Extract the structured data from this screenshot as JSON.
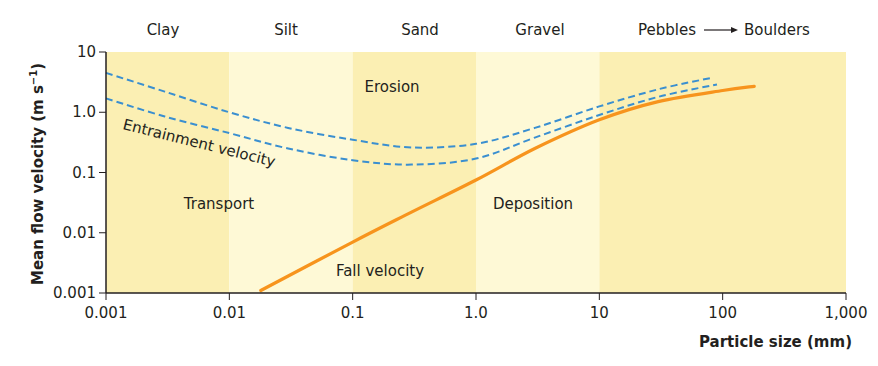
{
  "chart_data": {
    "type": "line",
    "title": "",
    "xlabel": "Particle size (mm)",
    "ylabel": "Mean flow velocity (m s⁻¹)",
    "xscale": "log",
    "yscale": "log",
    "xlim": [
      0.001,
      1000
    ],
    "ylim": [
      0.001,
      10
    ],
    "grid": false,
    "x_ticks": [
      {
        "value": 0.001,
        "label": "0.001"
      },
      {
        "value": 0.01,
        "label": "0.01"
      },
      {
        "value": 0.1,
        "label": "0.1"
      },
      {
        "value": 1,
        "label": "1.0"
      },
      {
        "value": 10,
        "label": "10"
      },
      {
        "value": 100,
        "label": "100"
      },
      {
        "value": 1000,
        "label": "1,000"
      }
    ],
    "y_ticks": [
      {
        "value": 10,
        "label": "10"
      },
      {
        "value": 1,
        "label": "1.0"
      },
      {
        "value": 0.1,
        "label": "0.1"
      },
      {
        "value": 0.01,
        "label": "0.01"
      },
      {
        "value": 0.001,
        "label": "0.001"
      }
    ],
    "bands": [
      {
        "name": "Clay",
        "x0": 0.001,
        "x1": 0.01,
        "color": "#fbefb3"
      },
      {
        "name": "Silt",
        "x0": 0.01,
        "x1": 0.1,
        "color": "#fef9d6"
      },
      {
        "name": "Sand",
        "x0": 0.1,
        "x1": 1,
        "color": "#fbefb3"
      },
      {
        "name": "Gravel",
        "x0": 1,
        "x1": 10,
        "color": "#fef9d6"
      },
      {
        "name": "Pebbles → Boulders",
        "x0": 10,
        "x1": 1000,
        "color": "#fbefb3"
      }
    ],
    "category_labels": [
      {
        "text": "Clay",
        "x": 0.0032
      },
      {
        "text": "Silt",
        "x": 0.031
      },
      {
        "text": "Sand",
        "x": 0.32
      },
      {
        "text": "Gravel",
        "x": 3.2
      },
      {
        "text": "Pebbles",
        "x": 30
      },
      {
        "text": "Boulders",
        "x": 330
      }
    ],
    "series": [
      {
        "name": "Entrainment velocity (upper bound)",
        "style": "dashed",
        "color": "#3a8fd0",
        "points": [
          [
            0.001,
            4.5
          ],
          [
            0.003,
            2.2
          ],
          [
            0.01,
            1.0
          ],
          [
            0.03,
            0.55
          ],
          [
            0.1,
            0.35
          ],
          [
            0.3,
            0.26
          ],
          [
            1,
            0.3
          ],
          [
            3,
            0.55
          ],
          [
            10,
            1.25
          ],
          [
            30,
            2.4
          ],
          [
            80,
            3.7
          ]
        ]
      },
      {
        "name": "Entrainment velocity (lower bound)",
        "style": "dashed",
        "color": "#3a8fd0",
        "points": [
          [
            0.001,
            1.7
          ],
          [
            0.003,
            0.85
          ],
          [
            0.01,
            0.45
          ],
          [
            0.03,
            0.25
          ],
          [
            0.1,
            0.16
          ],
          [
            0.3,
            0.135
          ],
          [
            1,
            0.17
          ],
          [
            3,
            0.38
          ],
          [
            10,
            0.9
          ],
          [
            30,
            1.8
          ],
          [
            90,
            2.9
          ]
        ]
      },
      {
        "name": "Fall velocity",
        "style": "solid",
        "color": "#f7941d",
        "points": [
          [
            0.018,
            0.0011
          ],
          [
            0.1,
            0.007
          ],
          [
            0.3,
            0.022
          ],
          [
            1,
            0.075
          ],
          [
            3,
            0.25
          ],
          [
            10,
            0.75
          ],
          [
            30,
            1.5
          ],
          [
            100,
            2.3
          ],
          [
            180,
            2.7
          ]
        ]
      }
    ],
    "annotations": [
      {
        "text": "Erosion",
        "x": 0.5,
        "y": 3.4
      },
      {
        "text": "Entrainment velocity",
        "x": 0.0014,
        "y": 0.4,
        "rotation": 14
      },
      {
        "text": "Transport",
        "x": 0.0043,
        "y": 0.03
      },
      {
        "text": "Deposition",
        "x": 4.5,
        "y": 0.03
      },
      {
        "text": "Fall velocity",
        "x": 0.22,
        "y": 0.0019
      }
    ],
    "arrow": {
      "from": "Pebbles",
      "to": "Boulders",
      "glyph": "→"
    }
  },
  "labels": {
    "xlabel": "Particle size (mm)",
    "ylabel": "Mean flow velocity (m s",
    "ylabel_sup": "−1",
    "ylabel_close": ")",
    "categories": {
      "clay": "Clay",
      "silt": "Silt",
      "sand": "Sand",
      "gravel": "Gravel",
      "pebbles": "Pebbles",
      "boulders": "Boulders"
    },
    "regions": {
      "erosion": "Erosion",
      "transport": "Transport",
      "deposition": "Deposition"
    },
    "curves": {
      "entrainment": "Entrainment velocity",
      "fall": "Fall velocity"
    }
  },
  "colors": {
    "band_dark": "#fbefb3",
    "band_light": "#fef9d6",
    "entrainment": "#3a8fd0",
    "fall": "#f7941d",
    "axis": "#231f20"
  }
}
